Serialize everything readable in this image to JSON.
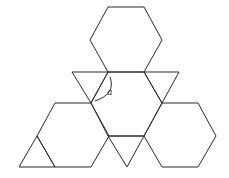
{
  "diagram": {
    "stroke_color": "#2b2b2b",
    "background": "#ffffff",
    "angle_label": "a",
    "shapes": {
      "hexagon_top": "108,7 144,7 162,40 144,72 108,72 90,40",
      "hexagon_center": "108,72 144,72 162,103 144,136 108,136 91,103",
      "hexagon_bottom_left": "55,103 91,103 109,136 91,167 55,167 37,136",
      "hexagon_bottom_right": "162,103 198,103 216,136 198,167 162,167 144,136",
      "triangle_left": "72,72 108,72 91,103",
      "triangle_right": "144,72 179,72 162,103",
      "triangle_bottom_middle": "108,136 144,136 127,167",
      "triangle_bottom_left": "37,136 55,167 19,167"
    },
    "angle_arc": "M 110 77 Q 116 94 95 101"
  }
}
